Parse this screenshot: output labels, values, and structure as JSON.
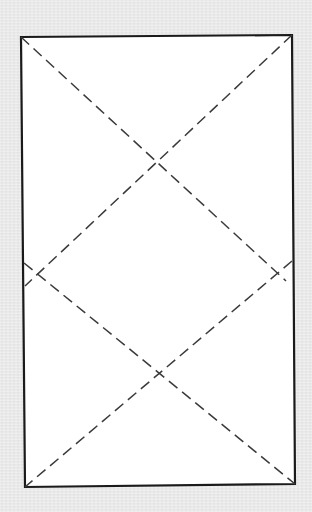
{
  "figure": {
    "colors": {
      "background": "#eaeaea",
      "rectangle_fill": "#ffffff",
      "rectangle_stroke": "#1a1a1a",
      "dash_stroke": "#3a3a3a"
    },
    "rectangle": {
      "corners": [
        [
          21,
          37
        ],
        [
          292,
          35
        ],
        [
          295,
          484
        ],
        [
          25,
          487
        ]
      ]
    },
    "dashed_lines": [
      {
        "from": [
          21,
          37
        ],
        "to": [
          286,
          281
        ]
      },
      {
        "from": [
          292,
          35
        ],
        "to": [
          25,
          286
        ]
      },
      {
        "from": [
          24,
          263
        ],
        "to": [
          295,
          484
        ]
      },
      {
        "from": [
          292,
          261
        ],
        "to": [
          25,
          487
        ]
      }
    ],
    "crossings": [
      [
        157,
        163
      ],
      [
        161,
        373
      ],
      [
        38,
        274
      ],
      [
        277,
        272
      ]
    ]
  }
}
